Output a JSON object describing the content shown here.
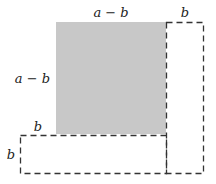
{
  "diagram": {
    "type": "geometric-area-decomposition",
    "shaded_square": {
      "label_top": "a − b",
      "label_left": "a − b",
      "fill": "#c8c8c8"
    },
    "right_rectangle": {
      "label_top": "b",
      "style": "dashed"
    },
    "bottom_rectangle": {
      "label_top": "b",
      "label_left": "b",
      "style": "dashed"
    },
    "stroke_color": "#333333"
  }
}
